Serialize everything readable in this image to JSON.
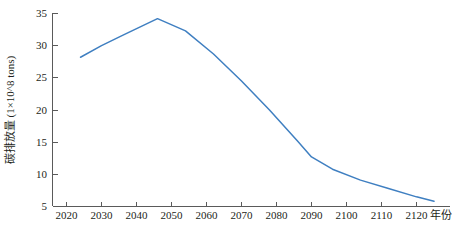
{
  "chart_data": {
    "type": "line",
    "title": "",
    "xlabel": "年份",
    "ylabel": "碳排放量 (1×10^8 tons)",
    "xlim": [
      2017,
      2130
    ],
    "ylim": [
      5,
      35
    ],
    "xticks": [
      "2020",
      "2030",
      "2040",
      "2050",
      "2060",
      "2070",
      "2080",
      "2090",
      "2100",
      "2110",
      "2120"
    ],
    "xtick_values": [
      2020,
      2030,
      2040,
      2050,
      2060,
      2070,
      2080,
      2090,
      2100,
      2110,
      2120
    ],
    "yticks": [
      "5",
      "10",
      "15",
      "20",
      "25",
      "30",
      "35"
    ],
    "ytick_values": [
      5,
      10,
      15,
      20,
      25,
      30,
      35
    ],
    "grid": false,
    "legend": false,
    "legend_position": "none",
    "series": [
      {
        "name": "碳排放量",
        "color": "#3f7fc1",
        "x": [
          2024,
          2030,
          2036,
          2046,
          2054,
          2062,
          2070,
          2078,
          2086,
          2090,
          2096,
          2104,
          2112,
          2120,
          2125
        ],
        "values": [
          28.2,
          30.0,
          31.6,
          34.2,
          32.3,
          28.7,
          24.5,
          20.0,
          15.2,
          12.7,
          10.8,
          9.1,
          7.8,
          6.5,
          5.8
        ]
      }
    ]
  },
  "axis": {
    "y_title": "碳排放量 (1×10^8 tons)",
    "x_title": "年份"
  }
}
